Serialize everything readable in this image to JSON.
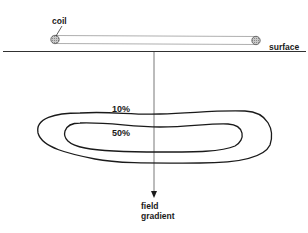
{
  "diagram": {
    "labels": {
      "coil": "coil",
      "surface": "surface",
      "contour_outer": "10%",
      "contour_inner": "50%",
      "field_gradient_line1": "field",
      "field_gradient_line2": "gradient"
    },
    "colors": {
      "line": "#1a1a1a",
      "coil_fill": "#b0b0b0",
      "tube": "#9a9a9a",
      "background": "#ffffff"
    }
  }
}
